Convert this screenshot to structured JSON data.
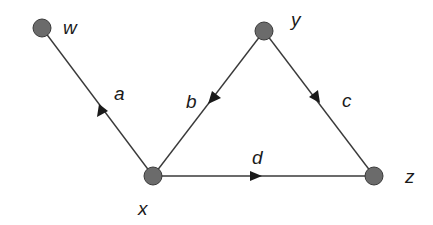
{
  "diagram": {
    "type": "directed-graph",
    "colors": {
      "node_fill": "#6b6b6b",
      "node_stroke": "#3a3a3a",
      "edge": "#3a3a3a",
      "arrow": "#1a1a1a",
      "text": "#1a1a1a"
    },
    "nodes": [
      {
        "id": "w",
        "label": "w",
        "x": 42,
        "y": 28
      },
      {
        "id": "y",
        "label": "y",
        "x": 264,
        "y": 31
      },
      {
        "id": "x",
        "label": "x",
        "x": 153,
        "y": 176
      },
      {
        "id": "z",
        "label": "z",
        "x": 374,
        "y": 176
      }
    ],
    "edges": [
      {
        "id": "a",
        "label": "a",
        "from": "x",
        "to": "w"
      },
      {
        "id": "b",
        "label": "b",
        "from": "y",
        "to": "x"
      },
      {
        "id": "c",
        "label": "c",
        "from": "y",
        "to": "z"
      },
      {
        "id": "d",
        "label": "d",
        "from": "x",
        "to": "z"
      }
    ]
  }
}
